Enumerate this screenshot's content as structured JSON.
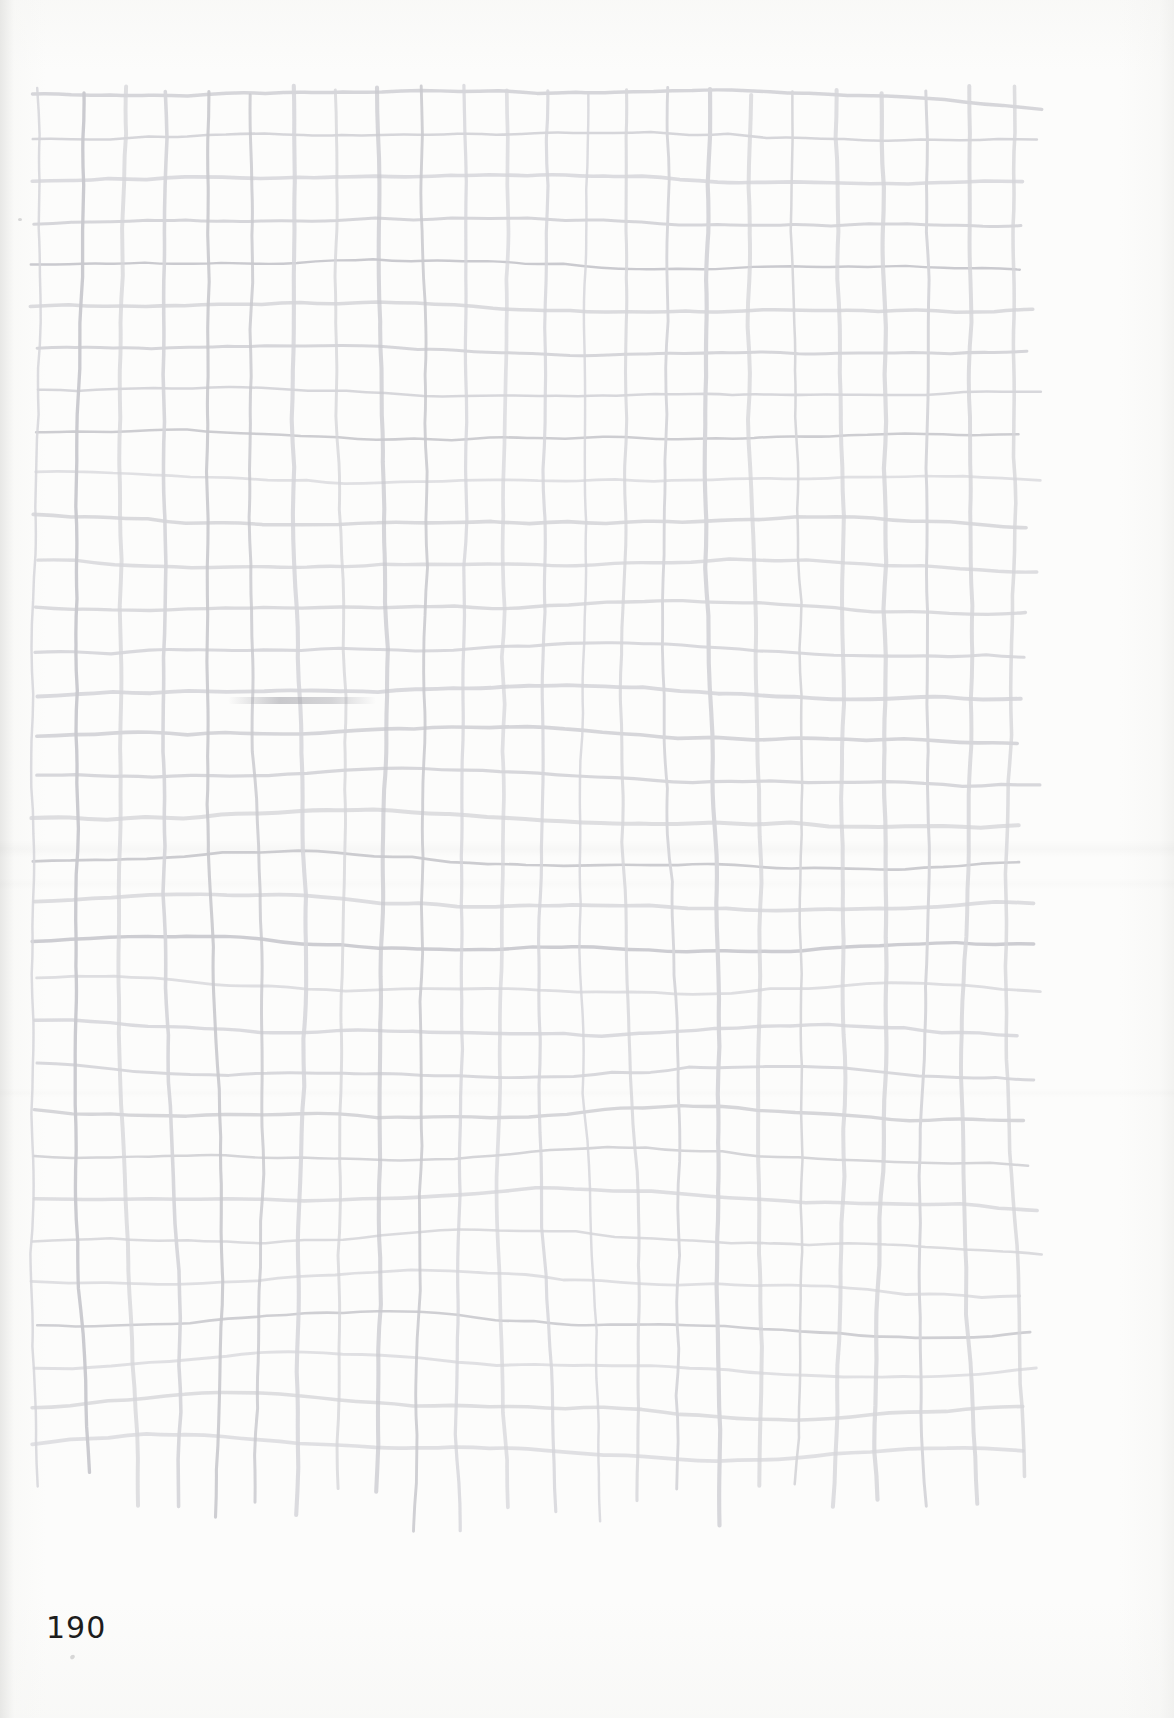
{
  "page": {
    "kind": "scanned-book-page",
    "page_number": "190",
    "width": 1174,
    "height": 1718,
    "background_color": "#fcfcfb",
    "paper_color": "#fdfdfc",
    "ink_color": "#1d1d1d"
  },
  "artwork": {
    "title": "",
    "description": "hand-drawn wobbly pencil grid",
    "line_color": "#d6d6da",
    "line_color_dark": "#c9c9ce",
    "line_width_min": 2.4,
    "line_width_max": 4.2,
    "vertical_line_count": 24,
    "horizontal_line_count": 33,
    "bounds": {
      "left": 36,
      "top": 92,
      "right": 1012,
      "bottom": 1445
    },
    "notes": [
      "top border steps down near the right edge",
      "vertical strokes trail off below the final horizontal line",
      "horizontal strokes overshoot slightly past the right-most vertical",
      "a faint graphite smudge sits mid-page on the left"
    ]
  },
  "marks": {
    "smudge_label": "graphite-smudge",
    "speck_label": "paper-speck"
  },
  "chart_data": {
    "type": "table",
    "xlabel": "",
    "ylabel": "",
    "categories": [],
    "values": [],
    "grid": true,
    "legend": "none",
    "columns": 23,
    "rows": 32
  }
}
